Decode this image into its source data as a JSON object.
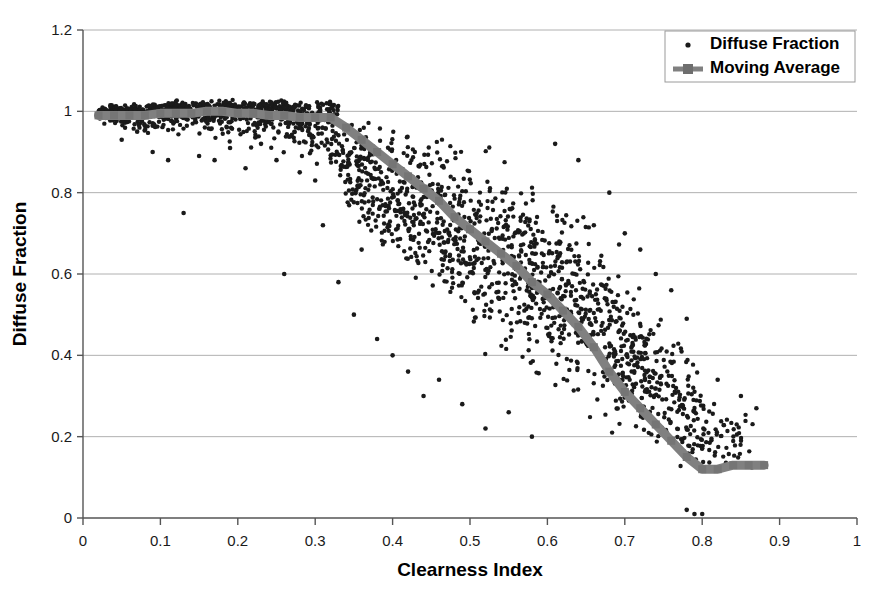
{
  "chart_data": {
    "type": "scatter",
    "title": "",
    "xlabel": "Clearness Index",
    "ylabel": "Diffuse Fraction",
    "xlim": [
      0,
      1
    ],
    "ylim": [
      0,
      1.2
    ],
    "xticks": [
      "0",
      "0.1",
      "0.2",
      "0.3",
      "0.4",
      "0.5",
      "0.6",
      "0.7",
      "0.8",
      "0.9",
      "1"
    ],
    "yticks": [
      "0",
      "0.2",
      "0.4",
      "0.6",
      "0.8",
      "1",
      "1.2"
    ],
    "xtick_values": [
      0,
      0.1,
      0.2,
      0.3,
      0.4,
      0.5,
      0.6,
      0.7,
      0.8,
      0.9,
      1
    ],
    "ytick_values": [
      0,
      0.2,
      0.4,
      0.6,
      0.8,
      1,
      1.2
    ],
    "grid": "horizontal",
    "legend_position": "top-right",
    "point_color": "#1a1a1a",
    "line_color": "#808080",
    "axis_color": "#808080",
    "grid_color": "#b0b0b0",
    "series": [
      {
        "name": "Diffuse Fraction",
        "type": "scatter",
        "marker": "dot",
        "color": "#1a1a1a",
        "n_points": 2400,
        "description": "Dense scatter of diffuse fraction versus clearness index; near 1.0 for low clearness index, falling to near 0.1 at high clearness index with wide vertical spread in the mid range.",
        "band": [
          {
            "x": 0.02,
            "lo": 0.97,
            "hi": 1.01,
            "density": 1.0
          },
          {
            "x": 0.05,
            "lo": 0.95,
            "hi": 1.01,
            "density": 1.0
          },
          {
            "x": 0.08,
            "lo": 0.93,
            "hi": 1.01,
            "density": 1.0
          },
          {
            "x": 0.12,
            "lo": 0.92,
            "hi": 1.02,
            "density": 1.0
          },
          {
            "x": 0.16,
            "lo": 0.92,
            "hi": 1.02,
            "density": 1.0
          },
          {
            "x": 0.2,
            "lo": 0.9,
            "hi": 1.02,
            "density": 1.0
          },
          {
            "x": 0.24,
            "lo": 0.88,
            "hi": 1.02,
            "density": 1.0
          },
          {
            "x": 0.28,
            "lo": 0.86,
            "hi": 1.02,
            "density": 1.0
          },
          {
            "x": 0.32,
            "lo": 0.8,
            "hi": 1.02,
            "density": 1.0
          },
          {
            "x": 0.36,
            "lo": 0.68,
            "hi": 1.01,
            "density": 1.0
          },
          {
            "x": 0.4,
            "lo": 0.58,
            "hi": 1.0,
            "density": 1.0
          },
          {
            "x": 0.44,
            "lo": 0.5,
            "hi": 0.99,
            "density": 1.0
          },
          {
            "x": 0.48,
            "lo": 0.44,
            "hi": 0.97,
            "density": 1.0
          },
          {
            "x": 0.52,
            "lo": 0.38,
            "hi": 0.95,
            "density": 1.0
          },
          {
            "x": 0.56,
            "lo": 0.33,
            "hi": 0.92,
            "density": 1.0
          },
          {
            "x": 0.6,
            "lo": 0.28,
            "hi": 0.88,
            "density": 1.0
          },
          {
            "x": 0.64,
            "lo": 0.22,
            "hi": 0.82,
            "density": 1.0
          },
          {
            "x": 0.68,
            "lo": 0.17,
            "hi": 0.74,
            "density": 1.0
          },
          {
            "x": 0.72,
            "lo": 0.12,
            "hi": 0.62,
            "density": 0.95
          },
          {
            "x": 0.76,
            "lo": 0.06,
            "hi": 0.5,
            "density": 0.85
          },
          {
            "x": 0.8,
            "lo": 0.04,
            "hi": 0.38,
            "density": 0.6
          },
          {
            "x": 0.84,
            "lo": 0.08,
            "hi": 0.3,
            "density": 0.25
          },
          {
            "x": 0.88,
            "lo": 0.1,
            "hi": 0.26,
            "density": 0.08
          }
        ],
        "outliers": [
          {
            "x": 0.05,
            "y": 0.93
          },
          {
            "x": 0.07,
            "y": 0.95
          },
          {
            "x": 0.09,
            "y": 0.9
          },
          {
            "x": 0.11,
            "y": 0.88
          },
          {
            "x": 0.13,
            "y": 0.75
          },
          {
            "x": 0.15,
            "y": 0.89
          },
          {
            "x": 0.17,
            "y": 0.88
          },
          {
            "x": 0.19,
            "y": 0.91
          },
          {
            "x": 0.21,
            "y": 0.86
          },
          {
            "x": 0.23,
            "y": 0.92
          },
          {
            "x": 0.25,
            "y": 0.88
          },
          {
            "x": 0.26,
            "y": 0.6
          },
          {
            "x": 0.28,
            "y": 0.85
          },
          {
            "x": 0.3,
            "y": 0.83
          },
          {
            "x": 0.31,
            "y": 0.72
          },
          {
            "x": 0.33,
            "y": 0.58
          },
          {
            "x": 0.35,
            "y": 0.5
          },
          {
            "x": 0.36,
            "y": 0.66
          },
          {
            "x": 0.38,
            "y": 0.44
          },
          {
            "x": 0.4,
            "y": 0.4
          },
          {
            "x": 0.42,
            "y": 0.36
          },
          {
            "x": 0.44,
            "y": 0.3
          },
          {
            "x": 0.46,
            "y": 0.34
          },
          {
            "x": 0.49,
            "y": 0.28
          },
          {
            "x": 0.52,
            "y": 0.22
          },
          {
            "x": 0.55,
            "y": 0.26
          },
          {
            "x": 0.58,
            "y": 0.2
          },
          {
            "x": 0.61,
            "y": 0.92
          },
          {
            "x": 0.64,
            "y": 0.88
          },
          {
            "x": 0.66,
            "y": 0.72
          },
          {
            "x": 0.68,
            "y": 0.8
          },
          {
            "x": 0.7,
            "y": 0.7
          },
          {
            "x": 0.72,
            "y": 0.66
          },
          {
            "x": 0.74,
            "y": 0.6
          },
          {
            "x": 0.76,
            "y": 0.56
          },
          {
            "x": 0.78,
            "y": 0.49
          },
          {
            "x": 0.79,
            "y": 0.01
          },
          {
            "x": 0.78,
            "y": 0.02
          },
          {
            "x": 0.8,
            "y": 0.01
          },
          {
            "x": 0.82,
            "y": 0.34
          },
          {
            "x": 0.85,
            "y": 0.3
          },
          {
            "x": 0.87,
            "y": 0.27
          }
        ]
      },
      {
        "name": "Moving Average",
        "type": "line",
        "marker": "square",
        "color": "#808080",
        "points": [
          {
            "x": 0.02,
            "y": 0.99
          },
          {
            "x": 0.04,
            "y": 0.99
          },
          {
            "x": 0.06,
            "y": 0.99
          },
          {
            "x": 0.08,
            "y": 0.99
          },
          {
            "x": 0.1,
            "y": 0.995
          },
          {
            "x": 0.12,
            "y": 0.995
          },
          {
            "x": 0.14,
            "y": 0.995
          },
          {
            "x": 0.16,
            "y": 1.0
          },
          {
            "x": 0.18,
            "y": 1.0
          },
          {
            "x": 0.2,
            "y": 0.995
          },
          {
            "x": 0.22,
            "y": 0.995
          },
          {
            "x": 0.24,
            "y": 0.99
          },
          {
            "x": 0.26,
            "y": 0.99
          },
          {
            "x": 0.28,
            "y": 0.985
          },
          {
            "x": 0.3,
            "y": 0.985
          },
          {
            "x": 0.32,
            "y": 0.985
          },
          {
            "x": 0.34,
            "y": 0.96
          },
          {
            "x": 0.36,
            "y": 0.93
          },
          {
            "x": 0.38,
            "y": 0.9
          },
          {
            "x": 0.4,
            "y": 0.87
          },
          {
            "x": 0.42,
            "y": 0.84
          },
          {
            "x": 0.44,
            "y": 0.81
          },
          {
            "x": 0.46,
            "y": 0.78
          },
          {
            "x": 0.48,
            "y": 0.74
          },
          {
            "x": 0.5,
            "y": 0.71
          },
          {
            "x": 0.52,
            "y": 0.68
          },
          {
            "x": 0.54,
            "y": 0.65
          },
          {
            "x": 0.56,
            "y": 0.62
          },
          {
            "x": 0.58,
            "y": 0.58
          },
          {
            "x": 0.6,
            "y": 0.55
          },
          {
            "x": 0.62,
            "y": 0.51
          },
          {
            "x": 0.64,
            "y": 0.47
          },
          {
            "x": 0.66,
            "y": 0.42
          },
          {
            "x": 0.68,
            "y": 0.36
          },
          {
            "x": 0.7,
            "y": 0.31
          },
          {
            "x": 0.72,
            "y": 0.27
          },
          {
            "x": 0.74,
            "y": 0.23
          },
          {
            "x": 0.76,
            "y": 0.19
          },
          {
            "x": 0.78,
            "y": 0.15
          },
          {
            "x": 0.8,
            "y": 0.12
          },
          {
            "x": 0.82,
            "y": 0.12
          },
          {
            "x": 0.84,
            "y": 0.13
          },
          {
            "x": 0.86,
            "y": 0.13
          },
          {
            "x": 0.88,
            "y": 0.13
          }
        ]
      }
    ]
  },
  "legend": {
    "items": [
      {
        "label": "Diffuse Fraction",
        "marker": "dot",
        "color": "#1a1a1a"
      },
      {
        "label": "Moving Average",
        "marker": "line-square",
        "color": "#808080"
      }
    ]
  }
}
